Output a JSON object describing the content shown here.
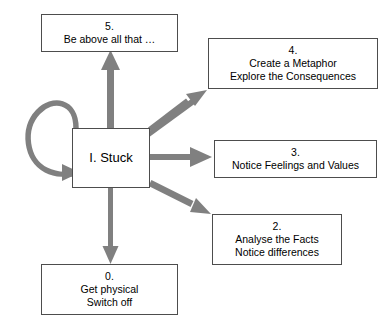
{
  "diagram": {
    "accent_color": "#808080",
    "border_color": "#4d4d4d",
    "text_color": "#000000",
    "background_color": "#ffffff",
    "center": {
      "id": "I",
      "label": "I. Stuck"
    },
    "nodes": [
      {
        "id": "5",
        "number": "5.",
        "lines": [
          "Be above all that …"
        ]
      },
      {
        "id": "4",
        "number": "4.",
        "lines": [
          "Create a Metaphor",
          "Explore the Consequences"
        ]
      },
      {
        "id": "3",
        "number": "3.",
        "lines": [
          "Notice Feelings and Values"
        ]
      },
      {
        "id": "2",
        "number": "2.",
        "lines": [
          "Analyse the Facts",
          "Notice differences"
        ]
      },
      {
        "id": "0",
        "number": "0.",
        "lines": [
          "Get physical",
          "Switch off"
        ]
      }
    ],
    "edges": [
      {
        "name": "self-loop",
        "from": "I. Stuck",
        "to": "I. Stuck",
        "style": "curved-loop-left"
      },
      {
        "name": "stuck-to-5",
        "from": "I. Stuck",
        "to": "5.",
        "style": "straight-up"
      },
      {
        "name": "stuck-to-4",
        "from": "I. Stuck",
        "to": "4.",
        "style": "diagonal-up-right"
      },
      {
        "name": "stuck-to-3",
        "from": "I. Stuck",
        "to": "3.",
        "style": "straight-right"
      },
      {
        "name": "stuck-to-2",
        "from": "I. Stuck",
        "to": "2.",
        "style": "diagonal-down-right"
      },
      {
        "name": "stuck-to-0",
        "from": "I. Stuck",
        "to": "0.",
        "style": "straight-down"
      }
    ]
  }
}
